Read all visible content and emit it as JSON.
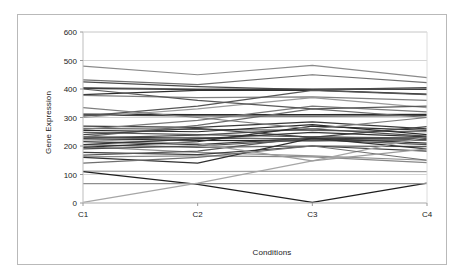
{
  "chart_data": {
    "type": "line",
    "title": "",
    "subtitle": "",
    "xlabel": "Conditions",
    "ylabel": "Gene Expression",
    "categories": [
      "C1",
      "C2",
      "C3",
      "C4"
    ],
    "x_tick_labels": [
      "C1",
      "C2",
      "C3",
      "C4"
    ],
    "y_tick_labels": [
      "0",
      "100",
      "200",
      "300",
      "400",
      "500",
      "600"
    ],
    "y_ticks": [
      0,
      100,
      200,
      300,
      400,
      500,
      600
    ],
    "ylim": [
      0,
      600
    ],
    "grid": "horizontal",
    "legend": "none",
    "legend_position": "none",
    "series": [
      {
        "name": "g1",
        "values": [
          480,
          450,
          483,
          440
        ],
        "color": "#8a8a8a"
      },
      {
        "name": "g2",
        "values": [
          432,
          415,
          450,
          422
        ],
        "color": "#707070"
      },
      {
        "name": "g3",
        "values": [
          425,
          408,
          398,
          405
        ],
        "color": "#4a4a4a"
      },
      {
        "name": "g4",
        "values": [
          405,
          400,
          398,
          400
        ],
        "color": "#6e6e6e"
      },
      {
        "name": "g5",
        "values": [
          402,
          398,
          400,
          399
        ],
        "color": "#3c3c3c"
      },
      {
        "name": "g6",
        "values": [
          380,
          395,
          396,
          382
        ],
        "color": "#2e2e2e"
      },
      {
        "name": "g7",
        "values": [
          378,
          370,
          372,
          360
        ],
        "color": "#808080"
      },
      {
        "name": "g8",
        "values": [
          312,
          310,
          310,
          311
        ],
        "color": "#2a2a2a"
      },
      {
        "name": "g9",
        "values": [
          308,
          306,
          305,
          307
        ],
        "color": "#454545"
      },
      {
        "name": "g10",
        "values": [
          305,
          340,
          395,
          380
        ],
        "color": "#555555"
      },
      {
        "name": "g11",
        "values": [
          270,
          265,
          285,
          260
        ],
        "color": "#3a3a3a"
      },
      {
        "name": "g12",
        "values": [
          262,
          258,
          255,
          250
        ],
        "color": "#666666"
      },
      {
        "name": "g13",
        "values": [
          255,
          250,
          275,
          240
        ],
        "color": "#2c2c2c"
      },
      {
        "name": "g14",
        "values": [
          248,
          240,
          232,
          228
        ],
        "color": "#5a5a5a"
      },
      {
        "name": "g15",
        "values": [
          232,
          228,
          225,
          228
        ],
        "color": "#333333"
      },
      {
        "name": "g16",
        "values": [
          228,
          238,
          260,
          235
        ],
        "color": "#4e4e4e"
      },
      {
        "name": "g17",
        "values": [
          225,
          220,
          218,
          222
        ],
        "color": "#262626"
      },
      {
        "name": "g18",
        "values": [
          222,
          230,
          222,
          220
        ],
        "color": "#6a6a6a"
      },
      {
        "name": "g19",
        "values": [
          215,
          205,
          228,
          210
        ],
        "color": "#383838"
      },
      {
        "name": "g20",
        "values": [
          205,
          195,
          200,
          198
        ],
        "color": "#5e5e5e"
      },
      {
        "name": "g21",
        "values": [
          198,
          178,
          165,
          150
        ],
        "color": "#909090"
      },
      {
        "name": "g22",
        "values": [
          195,
          215,
          270,
          255
        ],
        "color": "#2f2f2f"
      },
      {
        "name": "g23",
        "values": [
          190,
          200,
          222,
          205
        ],
        "color": "#4c4c4c"
      },
      {
        "name": "g24",
        "values": [
          178,
          170,
          200,
          182
        ],
        "color": "#3e3e3e"
      },
      {
        "name": "g25",
        "values": [
          168,
          182,
          232,
          225
        ],
        "color": "#585858"
      },
      {
        "name": "g26",
        "values": [
          162,
          165,
          162,
          142
        ],
        "color": "#888888"
      },
      {
        "name": "g27",
        "values": [
          160,
          140,
          228,
          190
        ],
        "color": "#303030"
      },
      {
        "name": "g28",
        "values": [
          232,
          272,
          330,
          300
        ],
        "color": "#6c6c6c"
      },
      {
        "name": "g29",
        "values": [
          258,
          290,
          340,
          320
        ],
        "color": "#7a7a7a"
      },
      {
        "name": "g30",
        "values": [
          300,
          330,
          370,
          335
        ],
        "color": "#9a9a9a"
      },
      {
        "name": "g31",
        "values": [
          112,
          110,
          112,
          110
        ],
        "color": "#a0a0a0"
      },
      {
        "name": "g32",
        "values": [
          110,
          65,
          2,
          70
        ],
        "color": "#1e1e1e"
      },
      {
        "name": "g33",
        "values": [
          68,
          68,
          68,
          68
        ],
        "color": "#8e8e8e"
      },
      {
        "name": "g34",
        "values": [
          2,
          70,
          148,
          232
        ],
        "color": "#a6a6a6"
      },
      {
        "name": "g35",
        "values": [
          140,
          160,
          200,
          150
        ],
        "color": "#6f6f6f"
      },
      {
        "name": "g36",
        "values": [
          222,
          208,
          148,
          190
        ],
        "color": "#9d9d9d"
      },
      {
        "name": "g37",
        "values": [
          335,
          300,
          260,
          300
        ],
        "color": "#7d7d7d"
      },
      {
        "name": "g38",
        "values": [
          400,
          360,
          330,
          340
        ],
        "color": "#575757"
      },
      {
        "name": "g39",
        "values": [
          240,
          262,
          230,
          268
        ],
        "color": "#444444"
      },
      {
        "name": "g40",
        "values": [
          205,
          225,
          248,
          232
        ],
        "color": "#353535"
      }
    ]
  },
  "axes": {
    "y_title": "Gene Expression",
    "x_title": "Conditions"
  }
}
